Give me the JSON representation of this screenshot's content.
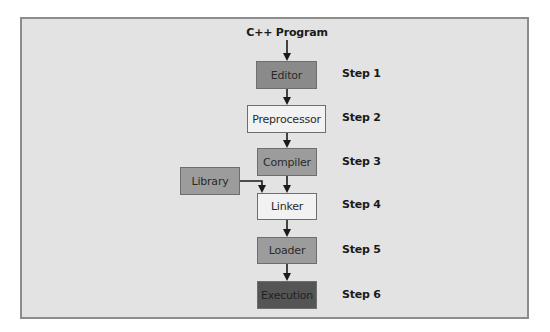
{
  "diagram": {
    "title": "C++ Program",
    "colors": {
      "background": "#e3e3e3",
      "frame_border": "#8c8c8c",
      "box_dark": "#555555",
      "box_medium_dark": "#8a8a8a",
      "box_medium": "#9c9c9c",
      "box_light": "#f2f2f2",
      "arrow": "#1a1a1a"
    },
    "nodes": [
      {
        "id": "editor",
        "label": "Editor",
        "step": "Step 1"
      },
      {
        "id": "preprocessor",
        "label": "Preprocessor",
        "step": "Step 2"
      },
      {
        "id": "compiler",
        "label": "Compiler",
        "step": "Step 3"
      },
      {
        "id": "linker",
        "label": "Linker",
        "step": "Step 4"
      },
      {
        "id": "loader",
        "label": "Loader",
        "step": "Step 5"
      },
      {
        "id": "execution",
        "label": "Execution",
        "step": "Step 6"
      }
    ],
    "side_node": {
      "id": "library",
      "label": "Library",
      "connects_to": "linker"
    },
    "edges": [
      [
        "title",
        "editor"
      ],
      [
        "editor",
        "preprocessor"
      ],
      [
        "preprocessor",
        "compiler"
      ],
      [
        "compiler",
        "linker"
      ],
      [
        "library",
        "linker"
      ],
      [
        "linker",
        "loader"
      ],
      [
        "loader",
        "execution"
      ]
    ]
  }
}
